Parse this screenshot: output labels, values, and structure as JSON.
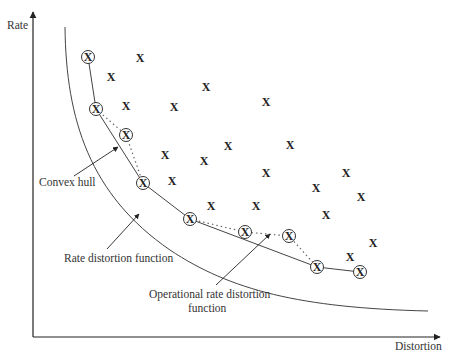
{
  "diagram": {
    "axes": {
      "y_label": "Rate",
      "x_label": "Distortion"
    },
    "annotations": {
      "convex_hull": "Convex hull",
      "rate_distortion": "Rate distortion function",
      "operational_line1": "Operational rate distortion",
      "operational_line2": "function"
    },
    "marker_glyph": "X",
    "colors": {
      "line": "#333333",
      "text": "#333333",
      "background": "#ffffff"
    },
    "circled_points": [
      [
        88,
        57
      ],
      [
        96,
        109
      ],
      [
        126,
        135
      ],
      [
        143,
        183
      ],
      [
        190,
        219
      ],
      [
        245,
        232
      ],
      [
        289,
        236
      ],
      [
        317,
        267
      ],
      [
        360,
        272
      ]
    ],
    "plain_points": [
      [
        140,
        58
      ],
      [
        111,
        77
      ],
      [
        206,
        87
      ],
      [
        126,
        106
      ],
      [
        174,
        107
      ],
      [
        266,
        102
      ],
      [
        165,
        155
      ],
      [
        204,
        161
      ],
      [
        228,
        146
      ],
      [
        290,
        145
      ],
      [
        266,
        173
      ],
      [
        172,
        181
      ],
      [
        316,
        188
      ],
      [
        346,
        173
      ],
      [
        211,
        206
      ],
      [
        256,
        206
      ],
      [
        326,
        215
      ],
      [
        361,
        197
      ],
      [
        373,
        243
      ],
      [
        350,
        257
      ]
    ],
    "convex_hull_path": [
      [
        88,
        57
      ],
      [
        96,
        109
      ],
      [
        143,
        183
      ],
      [
        190,
        219
      ],
      [
        317,
        267
      ],
      [
        360,
        272
      ]
    ],
    "operational_paths": [
      [
        [
          96,
          109
        ],
        [
          126,
          135
        ],
        [
          143,
          183
        ]
      ],
      [
        [
          190,
          219
        ],
        [
          245,
          232
        ],
        [
          289,
          236
        ],
        [
          317,
          267
        ]
      ]
    ]
  }
}
